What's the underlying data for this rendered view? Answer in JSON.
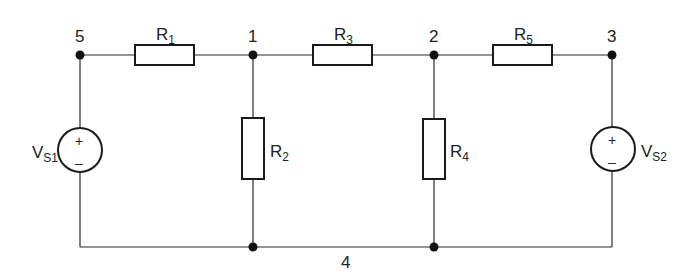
{
  "diagram": {
    "type": "electrical circuit schematic",
    "nodes": [
      {
        "id": "5",
        "label": "5"
      },
      {
        "id": "1",
        "label": "1"
      },
      {
        "id": "2",
        "label": "2"
      },
      {
        "id": "3",
        "label": "3"
      },
      {
        "id": "4",
        "label": "4"
      }
    ],
    "components": {
      "R1": {
        "main": "R",
        "sub": "1",
        "between": [
          "5",
          "1"
        ]
      },
      "R2": {
        "main": "R",
        "sub": "2",
        "between": [
          "1",
          "4"
        ]
      },
      "R3": {
        "main": "R",
        "sub": "3",
        "between": [
          "1",
          "2"
        ]
      },
      "R4": {
        "main": "R",
        "sub": "4",
        "between": [
          "2",
          "4"
        ]
      },
      "R5": {
        "main": "R",
        "sub": "5",
        "between": [
          "2",
          "3"
        ]
      },
      "VS1": {
        "main": "V",
        "sub": "S1",
        "between": [
          "5",
          "4"
        ],
        "plus": "+",
        "minus": "–"
      },
      "VS2": {
        "main": "V",
        "sub": "S2",
        "between": [
          "3",
          "4"
        ],
        "plus": "+",
        "minus": "–"
      }
    }
  }
}
